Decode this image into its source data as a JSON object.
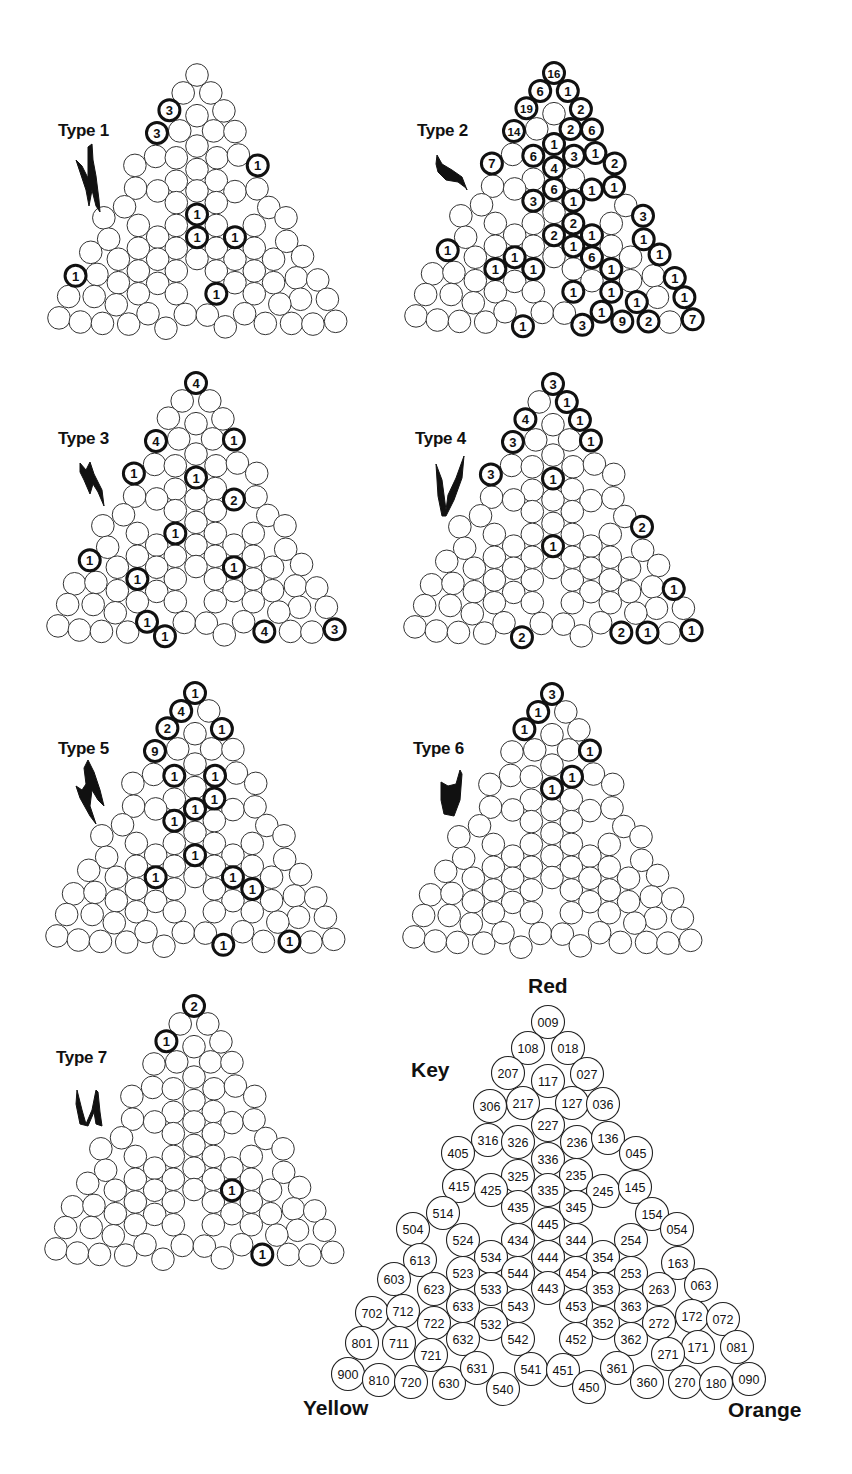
{
  "figure": {
    "key": {
      "title": "Key",
      "corner_labels": {
        "top": "Red",
        "bottom_left": "Yellow",
        "bottom_right": "Orange"
      },
      "circles": [
        {
          "code": "009",
          "x": 548,
          "y": 1022
        },
        {
          "code": "108",
          "x": 528,
          "y": 1048
        },
        {
          "code": "018",
          "x": 568,
          "y": 1048
        },
        {
          "code": "207",
          "x": 508,
          "y": 1073
        },
        {
          "code": "117",
          "x": 548,
          "y": 1081
        },
        {
          "code": "027",
          "x": 587,
          "y": 1074
        },
        {
          "code": "306",
          "x": 490,
          "y": 1106
        },
        {
          "code": "217",
          "x": 523,
          "y": 1103
        },
        {
          "code": "127",
          "x": 572,
          "y": 1103
        },
        {
          "code": "036",
          "x": 603,
          "y": 1104
        },
        {
          "code": "227",
          "x": 548,
          "y": 1125
        },
        {
          "code": "316",
          "x": 488,
          "y": 1140
        },
        {
          "code": "326",
          "x": 518,
          "y": 1142
        },
        {
          "code": "236",
          "x": 577,
          "y": 1142
        },
        {
          "code": "136",
          "x": 608,
          "y": 1138
        },
        {
          "code": "405",
          "x": 458,
          "y": 1153
        },
        {
          "code": "045",
          "x": 636,
          "y": 1153
        },
        {
          "code": "336",
          "x": 548,
          "y": 1159
        },
        {
          "code": "325",
          "x": 518,
          "y": 1176
        },
        {
          "code": "235",
          "x": 576,
          "y": 1175
        },
        {
          "code": "415",
          "x": 459,
          "y": 1186
        },
        {
          "code": "425",
          "x": 491,
          "y": 1190
        },
        {
          "code": "335",
          "x": 548,
          "y": 1190
        },
        {
          "code": "245",
          "x": 603,
          "y": 1191
        },
        {
          "code": "145",
          "x": 635,
          "y": 1187
        },
        {
          "code": "435",
          "x": 518,
          "y": 1207
        },
        {
          "code": "345",
          "x": 576,
          "y": 1207
        },
        {
          "code": "514",
          "x": 443,
          "y": 1213
        },
        {
          "code": "154",
          "x": 652,
          "y": 1214
        },
        {
          "code": "445",
          "x": 548,
          "y": 1224
        },
        {
          "code": "504",
          "x": 413,
          "y": 1229
        },
        {
          "code": "054",
          "x": 677,
          "y": 1229
        },
        {
          "code": "524",
          "x": 463,
          "y": 1240
        },
        {
          "code": "434",
          "x": 518,
          "y": 1240
        },
        {
          "code": "344",
          "x": 576,
          "y": 1240
        },
        {
          "code": "254",
          "x": 631,
          "y": 1240
        },
        {
          "code": "534",
          "x": 491,
          "y": 1257
        },
        {
          "code": "444",
          "x": 548,
          "y": 1257
        },
        {
          "code": "354",
          "x": 603,
          "y": 1257
        },
        {
          "code": "613",
          "x": 420,
          "y": 1260
        },
        {
          "code": "163",
          "x": 678,
          "y": 1263
        },
        {
          "code": "523",
          "x": 463,
          "y": 1273
        },
        {
          "code": "544",
          "x": 518,
          "y": 1273
        },
        {
          "code": "454",
          "x": 576,
          "y": 1273
        },
        {
          "code": "253",
          "x": 631,
          "y": 1273
        },
        {
          "code": "603",
          "x": 394,
          "y": 1279
        },
        {
          "code": "063",
          "x": 701,
          "y": 1285
        },
        {
          "code": "623",
          "x": 434,
          "y": 1289
        },
        {
          "code": "533",
          "x": 491,
          "y": 1289
        },
        {
          "code": "443",
          "x": 548,
          "y": 1288
        },
        {
          "code": "353",
          "x": 603,
          "y": 1289
        },
        {
          "code": "263",
          "x": 659,
          "y": 1289
        },
        {
          "code": "702",
          "x": 372,
          "y": 1313
        },
        {
          "code": "712",
          "x": 403,
          "y": 1311
        },
        {
          "code": "633",
          "x": 463,
          "y": 1306
        },
        {
          "code": "543",
          "x": 518,
          "y": 1306
        },
        {
          "code": "453",
          "x": 576,
          "y": 1306
        },
        {
          "code": "363",
          "x": 631,
          "y": 1306
        },
        {
          "code": "172",
          "x": 692,
          "y": 1316
        },
        {
          "code": "072",
          "x": 723,
          "y": 1319
        },
        {
          "code": "722",
          "x": 434,
          "y": 1323
        },
        {
          "code": "532",
          "x": 491,
          "y": 1324
        },
        {
          "code": "352",
          "x": 603,
          "y": 1323
        },
        {
          "code": "272",
          "x": 659,
          "y": 1323
        },
        {
          "code": "801",
          "x": 362,
          "y": 1343
        },
        {
          "code": "711",
          "x": 399,
          "y": 1343
        },
        {
          "code": "632",
          "x": 463,
          "y": 1339
        },
        {
          "code": "542",
          "x": 518,
          "y": 1339
        },
        {
          "code": "452",
          "x": 576,
          "y": 1339
        },
        {
          "code": "362",
          "x": 631,
          "y": 1339
        },
        {
          "code": "171",
          "x": 698,
          "y": 1347
        },
        {
          "code": "081",
          "x": 737,
          "y": 1347
        },
        {
          "code": "721",
          "x": 431,
          "y": 1355
        },
        {
          "code": "271",
          "x": 668,
          "y": 1354
        },
        {
          "code": "900",
          "x": 348,
          "y": 1374
        },
        {
          "code": "810",
          "x": 379,
          "y": 1380
        },
        {
          "code": "720",
          "x": 411,
          "y": 1382
        },
        {
          "code": "630",
          "x": 449,
          "y": 1383
        },
        {
          "code": "631",
          "x": 477,
          "y": 1368
        },
        {
          "code": "540",
          "x": 503,
          "y": 1389
        },
        {
          "code": "541",
          "x": 531,
          "y": 1369
        },
        {
          "code": "451",
          "x": 563,
          "y": 1370
        },
        {
          "code": "450",
          "x": 589,
          "y": 1387
        },
        {
          "code": "361",
          "x": 617,
          "y": 1368
        },
        {
          "code": "360",
          "x": 647,
          "y": 1382
        },
        {
          "code": "270",
          "x": 685,
          "y": 1382
        },
        {
          "code": "180",
          "x": 716,
          "y": 1383
        },
        {
          "code": "090",
          "x": 749,
          "y": 1379
        }
      ]
    },
    "panels": [
      {
        "label": "Type 1",
        "icon": "type-1-glyph",
        "top": {
          "x": 197,
          "y": 75
        },
        "counts": {
          "207": "3",
          "306": "3",
          "045": "1",
          "445": "1",
          "444": "1",
          "354": "1",
          "702": "1",
          "452": "1"
        }
      },
      {
        "label": "Type 2",
        "icon": "type-2-glyph",
        "top": {
          "x": 554,
          "y": 73
        },
        "counts": {
          "009": "16",
          "108": "6",
          "018": "1",
          "207": "19",
          "027": "2",
          "306": "14",
          "127": "2",
          "036": "6",
          "227": "1",
          "326": "6",
          "236": "3",
          "136": "1",
          "405": "7",
          "336": "4",
          "045": "2",
          "335": "6",
          "245": "1",
          "145": "1",
          "435": "3",
          "345": "1",
          "344": "2",
          "444": "2",
          "354": "1",
          "454": "1",
          "353": "6",
          "363": "1",
          "452": "1",
          "362": "1",
          "271": "1",
          "361": "1",
          "450": "3",
          "360": "9",
          "270": "2",
          "090": "7",
          "054": "3",
          "163": "1",
          "063": "1",
          "072": "1",
          "081": "1",
          "603": "1",
          "533": "1",
          "633": "1",
          "543": "1",
          "540": "1"
        }
      },
      {
        "label": "Type 3",
        "icon": "type-3-glyph",
        "top": {
          "x": 196,
          "y": 383
        },
        "counts": {
          "009": "4",
          "306": "4",
          "036": "1",
          "405": "1",
          "336": "1",
          "245": "2",
          "434": "1",
          "603": "1",
          "353": "1",
          "633": "1",
          "631": "1",
          "540": "1",
          "360": "4",
          "090": "3"
        }
      },
      {
        "label": "Type 4",
        "icon": "type-4-glyph",
        "top": {
          "x": 553,
          "y": 384
        },
        "counts": {
          "009": "3",
          "018": "1",
          "207": "4",
          "027": "1",
          "306": "3",
          "036": "1",
          "405": "3",
          "336": "1",
          "054": "2",
          "444": "1",
          "072": "1",
          "540": "2",
          "360": "2",
          "270": "1",
          "090": "1"
        }
      },
      {
        "label": "Type 5",
        "icon": "type-5-glyph",
        "top": {
          "x": 195,
          "y": 693
        },
        "counts": {
          "009": "1",
          "108": "4",
          "207": "2",
          "027": "1",
          "306": "9",
          "326": "1",
          "236": "1",
          "235": "1",
          "335": "1",
          "435": "1",
          "444": "1",
          "533": "1",
          "353": "1",
          "363": "1",
          "450": "1",
          "270": "1"
        }
      },
      {
        "label": "Type 6",
        "icon": "type-6-glyph",
        "top": {
          "x": 552,
          "y": 694
        },
        "counts": {
          "009": "3",
          "108": "1",
          "207": "1",
          "036": "1",
          "236": "1",
          "336": "1"
        }
      },
      {
        "label": "Type 7",
        "icon": "type-7-glyph",
        "top": {
          "x": 194,
          "y": 1006
        },
        "counts": {
          "009": "2",
          "207": "1",
          "353": "1",
          "360": "1"
        }
      }
    ]
  }
}
